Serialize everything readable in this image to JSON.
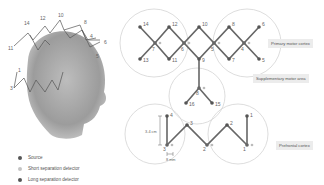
{
  "colors": {
    "source": "#555555",
    "short_detector": "#b8b8b8",
    "long_detector": "#555555",
    "line": "#666666",
    "circle": "#cfcfcf",
    "tag_bg": "#ececec"
  },
  "regions": [
    {
      "label": "Primary motor cortex"
    },
    {
      "label": "Supplementary motor area"
    },
    {
      "label": "Prefrontal cortex"
    }
  ],
  "measurements": {
    "vertical": "3-4 cm",
    "horizontal": "8 mm"
  },
  "legend": [
    {
      "label": "Source",
      "type": "source"
    },
    {
      "label": "Short separation detector",
      "type": "short"
    },
    {
      "label": "Long separation detector",
      "type": "long"
    }
  ],
  "head_labels": [
    "14",
    "12",
    "10",
    "8",
    "6",
    "4",
    "13",
    "5",
    "3",
    "1",
    "11"
  ],
  "motor_labels": {
    "n14": "14",
    "n12": "12",
    "n10": "10",
    "n8": "8",
    "n6": "6",
    "n13": "13",
    "n11": "11",
    "n9": "9",
    "n7": "7",
    "n5": "5",
    "s7": "7",
    "s6": "6",
    "s5": "5",
    "s4": "4"
  },
  "sma_labels": {
    "n16": "16",
    "n15": "15",
    "s8": "8"
  },
  "prefrontal_labels": {
    "n4": "4",
    "n3": "3",
    "n2": "2",
    "n1": "1",
    "s1": "1",
    "s2": "2",
    "s3": "3"
  }
}
